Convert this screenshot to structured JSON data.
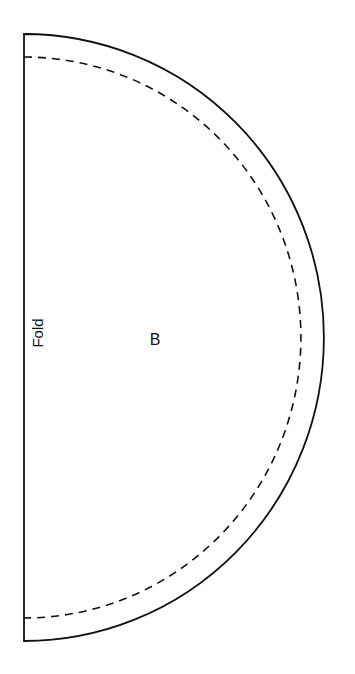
{
  "pattern_piece": {
    "piece_label": "B",
    "fold_label": "Fold",
    "shape": "half-circle",
    "lines": {
      "cut_line": "solid",
      "seam_line": "dashed"
    },
    "colors": {
      "line": "#111111",
      "background": "#ffffff"
    }
  }
}
